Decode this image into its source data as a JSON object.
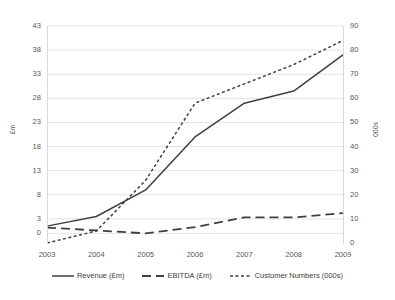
{
  "chart_data": {
    "type": "line",
    "title": "",
    "subtitle": "",
    "xlabel": "",
    "ylabel": "£m",
    "y2label": "000s",
    "categories": [
      "2003",
      "2004",
      "2005",
      "2006",
      "2007",
      "2008",
      "2009"
    ],
    "grid": true,
    "legend_position": "bottom",
    "ylim": [
      -2,
      43
    ],
    "yticks": [
      0,
      3,
      8,
      13,
      18,
      23,
      28,
      33,
      38,
      43
    ],
    "y2lim": [
      0,
      90
    ],
    "y2ticks": [
      0,
      10,
      20,
      30,
      40,
      50,
      60,
      70,
      80,
      90
    ],
    "series": [
      {
        "name": "Revenue (£m)",
        "axis": "left",
        "style": "solid",
        "color": "#404040",
        "values": [
          1.5,
          3.5,
          9,
          20,
          27,
          29.5,
          37
        ]
      },
      {
        "name": "EBITDA (£m)",
        "axis": "left",
        "style": "dashed",
        "color": "#404040",
        "values": [
          1.2,
          0.6,
          0,
          1.3,
          3.3,
          3.3,
          4.2
        ]
      },
      {
        "name": "Customer Numbers (000s)",
        "axis": "right",
        "style": "dotted",
        "color": "#404040",
        "values": [
          0,
          5,
          26,
          58,
          66,
          74,
          84
        ]
      }
    ]
  },
  "axes": {
    "left_title": "£m",
    "right_title": "000s",
    "left_ticks": [
      "43",
      "38",
      "33",
      "28",
      "23",
      "18",
      "13",
      "8",
      "3",
      "0"
    ],
    "right_ticks": [
      "90",
      "80",
      "70",
      "60",
      "50",
      "40",
      "30",
      "20",
      "10",
      "0"
    ],
    "x_ticks": [
      "2003",
      "2004",
      "2005",
      "2006",
      "2007",
      "2008",
      "2009"
    ]
  },
  "legend": {
    "items": [
      {
        "label": "Revenue (£m)",
        "style": "solid"
      },
      {
        "label": "EBITDA (£m)",
        "style": "dashed"
      },
      {
        "label": "Customer Numbers (000s)",
        "style": "dotted"
      }
    ]
  },
  "colors": {
    "line": "#404040",
    "grid": "#e3e3e3",
    "text": "#575757",
    "background": "#ffffff"
  }
}
